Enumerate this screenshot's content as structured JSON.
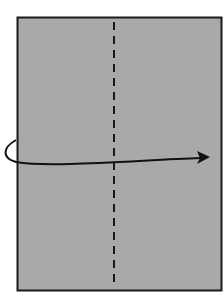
{
  "diagram": {
    "type": "origami-fold-instruction",
    "paper": {
      "fill": "#a9a9a9",
      "stroke": "#1a1a1a",
      "x": 17,
      "y": 17,
      "width": 204,
      "height": 274
    },
    "fold_line": {
      "style": "valley-dashed",
      "x": 114,
      "color": "#1a1a1a"
    },
    "arrow": {
      "direction": "left-to-right",
      "color": "#111111"
    }
  }
}
